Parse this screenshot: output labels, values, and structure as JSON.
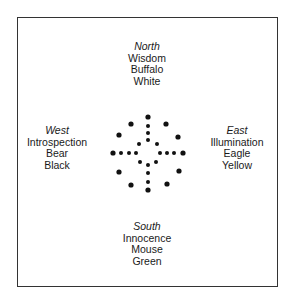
{
  "directions": {
    "north": {
      "name": "North",
      "quality": "Wisdom",
      "animal": "Buffalo",
      "color": "White"
    },
    "west": {
      "name": "West",
      "quality": "Introspection",
      "animal": "Bear",
      "color": "Black"
    },
    "east": {
      "name": "East",
      "quality": "Illumination",
      "animal": "Eagle",
      "color": "Yellow"
    },
    "south": {
      "name": "South",
      "quality": "Innocence",
      "animal": "Mouse",
      "color": "Green"
    }
  }
}
